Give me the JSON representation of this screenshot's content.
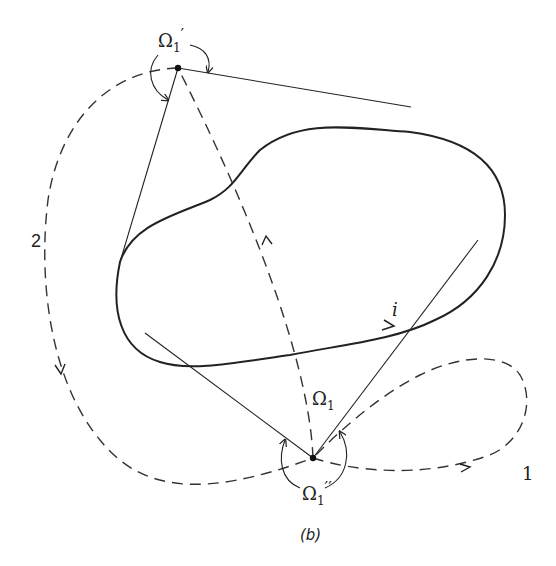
{
  "figure": {
    "caption": "(b)",
    "labels": {
      "omega_top": "Ω",
      "omega_top_sub": "1",
      "omega_top_prime": "′",
      "omega_mid": "Ω",
      "omega_mid_sub": "1",
      "omega_bottom": "Ω",
      "omega_bottom_sub": "1",
      "omega_bottom_prime": "′′",
      "current": "i",
      "path_1": "1",
      "path_2": "2"
    },
    "colors": {
      "stroke": "#222222",
      "dashed": "#333333",
      "background": "#ffffff"
    },
    "elements": [
      "closed current loop i (solid, with direction arrow)",
      "point Ω1′ (top) with tangent lines to loop",
      "point Ω1′′ (bottom) with tangent lines to loop",
      "dashed path Ω1 from bottom point to top point",
      "dashed path 1 (small loop to the right)",
      "dashed path 2 (large loop to the left)"
    ]
  }
}
